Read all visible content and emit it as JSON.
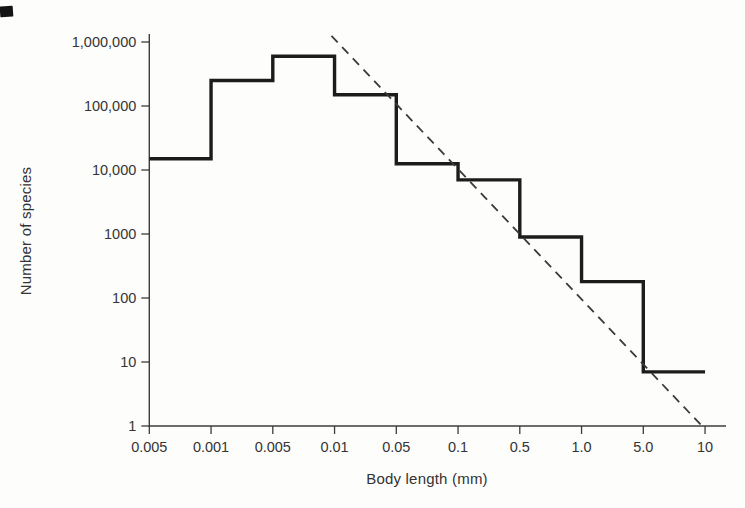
{
  "chart_data": {
    "type": "line",
    "subtype": "step-histogram-log-log",
    "title": "",
    "xlabel": "Body length (mm)",
    "ylabel": "Number of species",
    "grid": false,
    "legend": null,
    "ylim": [
      1,
      1000000
    ],
    "x_tick_labels": [
      "0.005",
      "0.001",
      "0.005",
      "0.01",
      "0.05",
      "0.1",
      "0.5",
      "1.0",
      "5.0",
      "10"
    ],
    "y_ticks": [
      {
        "value": 1000000,
        "label": "1,000,000"
      },
      {
        "value": 100000,
        "label": "100,000"
      },
      {
        "value": 10000,
        "label": "10,000"
      },
      {
        "value": 1000,
        "label": "1000"
      },
      {
        "value": 100,
        "label": "100"
      },
      {
        "value": 10,
        "label": "10"
      },
      {
        "value": 1,
        "label": "1"
      }
    ],
    "series": [
      {
        "name": "species-count-histogram",
        "style": "solid-step",
        "bins": [
          {
            "x_from_label": "0.005",
            "x_to_label": "0.001",
            "species": 15000
          },
          {
            "x_from_label": "0.001",
            "x_to_label": "0.005",
            "species": 250000
          },
          {
            "x_from_label": "0.005",
            "x_to_label": "0.01",
            "species": 600000
          },
          {
            "x_from_label": "0.01",
            "x_to_label": "0.05",
            "species": 150000
          },
          {
            "x_from_label": "0.05",
            "x_to_label": "0.1",
            "species": 12500
          },
          {
            "x_from_label": "0.1",
            "x_to_label": "0.5",
            "species": 7000
          },
          {
            "x_from_label": "0.5",
            "x_to_label": "1.0",
            "species": 900
          },
          {
            "x_from_label": "1.0",
            "x_to_label": "5.0",
            "species": 180
          },
          {
            "x_from_label": "5.0",
            "x_to_label": "10",
            "species": 7
          }
        ]
      },
      {
        "name": "reference-line",
        "style": "dashed",
        "points": [
          {
            "x_tick": 2.95,
            "y": 1250000
          },
          {
            "x_tick": 8.95,
            "y": 1
          }
        ]
      }
    ],
    "colors": {
      "histogram": "#1c1c1c",
      "reference": "#3a3a3a",
      "axis": "#3c3c3c",
      "text": "#343434"
    }
  }
}
